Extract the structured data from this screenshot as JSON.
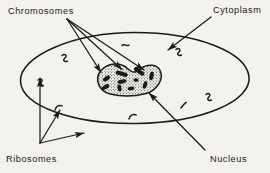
{
  "figure": {
    "kind": "hand-drawn-biology-diagram",
    "background_color": "#f4f2ee",
    "ink_color": "#1c1a18"
  },
  "labels": {
    "chromosomes": "Chromosomes",
    "cytoplasm": "Cytoplasm",
    "ribosomes": "Ribosomes",
    "nucleus": "Nucleus"
  },
  "structures": {
    "cell_membrane": {
      "name": "cell-membrane",
      "shape": "ellipse"
    },
    "nucleus": {
      "name": "nucleus",
      "shape": "stippled-peanut-blob",
      "fill": "stipple"
    },
    "chromosomes": {
      "name": "chromosomes",
      "count": 10,
      "appearance": "short dark rods inside nucleus"
    },
    "ribosomes": {
      "name": "ribosomes",
      "count": 8,
      "appearance": "small squiggle marks in cytoplasm"
    }
  },
  "leaders": {
    "chromosomes": {
      "name": "chromosomes-leader",
      "arrow_count": 3,
      "direction": "from upper-left label down-right to nucleus"
    },
    "cytoplasm": {
      "name": "cytoplasm-leader",
      "arrow_count": 1,
      "direction": "from upper-right label down-left across membrane"
    },
    "ribosomes": {
      "name": "ribosomes-leader",
      "arrow_count": 3,
      "direction": "from lower-left label fanning up and right"
    },
    "nucleus": {
      "name": "nucleus-leader",
      "arrow_count": 1,
      "direction": "from lower-right label up-left to nucleus"
    }
  }
}
